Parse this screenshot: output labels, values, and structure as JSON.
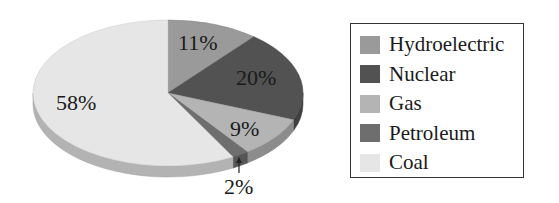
{
  "chart_data": {
    "type": "pie",
    "title": "",
    "style": "3d",
    "categories": [
      "Hydroelectric",
      "Nuclear",
      "Gas",
      "Petroleum",
      "Coal"
    ],
    "values": [
      11,
      20,
      9,
      2,
      58
    ],
    "labels": [
      "11%",
      "20%",
      "9%",
      "2%",
      "58%"
    ],
    "colors": [
      "#9a9a9a",
      "#525252",
      "#b4b4b4",
      "#6e6e6e",
      "#e6e6e6"
    ],
    "legend_position": "right",
    "annotations": [
      {
        "text": "2%",
        "type": "arrow-callout",
        "target": "Petroleum"
      }
    ]
  },
  "legend": {
    "items": [
      {
        "label": "Hydroelectric",
        "color": "#9a9a9a"
      },
      {
        "label": "Nuclear",
        "color": "#525252"
      },
      {
        "label": "Gas",
        "color": "#b4b4b4"
      },
      {
        "label": "Petroleum",
        "color": "#6e6e6e"
      },
      {
        "label": "Coal",
        "color": "#e6e6e6"
      }
    ]
  },
  "slice_labels": {
    "hydroelectric": "11%",
    "nuclear": "20%",
    "gas": "9%",
    "petroleum": "2%",
    "coal": "58%"
  }
}
